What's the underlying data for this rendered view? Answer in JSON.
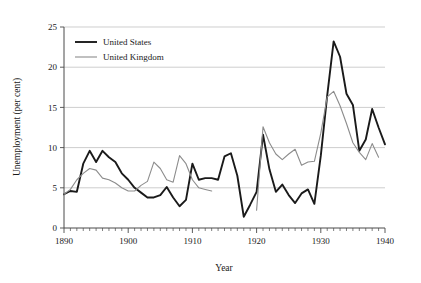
{
  "chart_data": {
    "type": "line",
    "title": "",
    "xlabel": "Year",
    "ylabel": "Unemployment (per cent)",
    "xlim": [
      1890,
      1940
    ],
    "ylim": [
      0,
      25
    ],
    "xticks": [
      1890,
      1900,
      1910,
      1920,
      1930,
      1940
    ],
    "yticks": [
      0,
      5,
      10,
      15,
      20,
      25
    ],
    "xtick_labels": [
      "1890",
      "1900",
      "1910",
      "1920",
      "1930",
      "1940"
    ],
    "ytick_labels": [
      "0",
      "5",
      "10",
      "15",
      "20",
      "25"
    ],
    "minor_xticks_interval": 1,
    "grid": "horizontal",
    "legend_position": "top-left",
    "series": [
      {
        "name": "United States",
        "color": "#1a1a1a",
        "x": [
          1890,
          1891,
          1892,
          1893,
          1894,
          1895,
          1896,
          1897,
          1898,
          1899,
          1900,
          1901,
          1902,
          1903,
          1904,
          1905,
          1906,
          1907,
          1908,
          1909,
          1910,
          1911,
          1912,
          1913,
          1914,
          1915,
          1916,
          1917,
          1918,
          1919,
          1920,
          1921,
          1922,
          1923,
          1924,
          1925,
          1926,
          1927,
          1928,
          1929,
          1930,
          1931,
          1932,
          1933,
          1934,
          1935,
          1936,
          1937,
          1938,
          1939,
          1940
        ],
        "values": [
          4.2,
          4.6,
          4.5,
          8.0,
          9.6,
          8.2,
          9.6,
          8.8,
          8.2,
          6.8,
          6.0,
          5.0,
          4.4,
          3.8,
          3.8,
          4.1,
          5.1,
          3.8,
          2.7,
          3.5,
          8.0,
          6.0,
          6.2,
          6.2,
          6.0,
          8.9,
          9.3,
          6.5,
          1.4,
          2.9,
          4.5,
          11.6,
          7.3,
          4.5,
          5.4,
          4.1,
          3.1,
          4.3,
          4.8,
          3.0,
          9.0,
          16.5,
          23.2,
          21.3,
          16.7,
          15.3,
          9.6,
          11.0,
          14.8,
          12.5,
          10.4
        ]
      },
      {
        "name": "United Kingdom",
        "color": "#8c8c8c",
        "x": [
          1890,
          1891,
          1892,
          1893,
          1894,
          1895,
          1896,
          1897,
          1898,
          1899,
          1900,
          1901,
          1902,
          1903,
          1904,
          1905,
          1906,
          1907,
          1908,
          1909,
          1910,
          1911,
          1912,
          1913,
          null,
          1920,
          1921,
          1922,
          1923,
          1924,
          1925,
          1926,
          1927,
          1928,
          1929,
          1930,
          1931,
          1932,
          1933,
          1934,
          1935,
          1936,
          1937,
          1938,
          1939
        ],
        "values": [
          4.2,
          4.8,
          6.0,
          6.8,
          7.4,
          7.2,
          6.2,
          6.0,
          5.6,
          5.0,
          4.6,
          4.6,
          5.3,
          5.8,
          8.2,
          7.4,
          6.0,
          5.7,
          9.0,
          8.0,
          6.0,
          5.0,
          4.8,
          4.6,
          null,
          2.2,
          12.6,
          10.6,
          9.2,
          8.5,
          9.2,
          9.8,
          7.8,
          8.2,
          8.3,
          11.8,
          16.3,
          17.0,
          15.2,
          13.0,
          10.6,
          9.4,
          8.5,
          10.5,
          8.8
        ]
      }
    ]
  },
  "legend": {
    "items": [
      {
        "label": "United States",
        "color": "#1a1a1a",
        "width": 1.9
      },
      {
        "label": "United Kingdom",
        "color": "#8c8c8c",
        "width": 1.1
      }
    ]
  },
  "axes": {
    "y_title": "Unemployment (per cent)",
    "x_title": "Year"
  }
}
